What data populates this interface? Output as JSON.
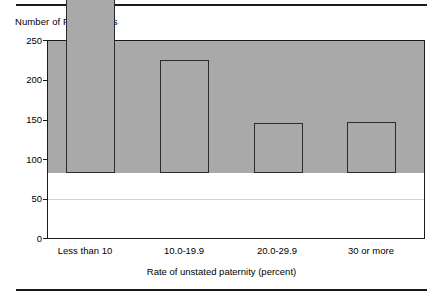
{
  "rules": {
    "top_label": "top-divider",
    "bottom_label": "bottom-divider"
  },
  "chart_data": {
    "type": "bar",
    "title": "",
    "ylabel": "Number of First Nations",
    "xlabel": "Rate of unstated paternity (percent)",
    "categories": [
      "Less than 10",
      "10.0-19.9",
      "20.0-29.9",
      "30 or more"
    ],
    "values": [
      168,
      227,
      144,
      63
    ],
    "ylim": [
      0,
      250
    ],
    "yticks": [
      0,
      50,
      100,
      150,
      200,
      250
    ],
    "ytick_labels": [
      "0",
      "50",
      "100",
      "150",
      "200",
      "250"
    ],
    "grid": "horizontal",
    "legend": "none",
    "colors": {
      "bar_fill": "#a9a9a9",
      "bar_edge": "#2b2b2b",
      "gridline": "#d2d2d2",
      "axis": "#1a1a1a",
      "background": "#ffffff"
    }
  }
}
